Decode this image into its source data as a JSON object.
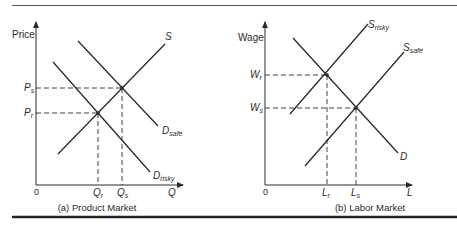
{
  "panels": [
    {
      "caption": "(a) Product Market",
      "y_axis_label": "Price",
      "x_axis_label": "Q",
      "origin": "0",
      "y_ticks": [
        {
          "base": "P",
          "sub": "s"
        },
        {
          "base": "P",
          "sub": "r"
        }
      ],
      "x_ticks": [
        {
          "base": "Q",
          "sub": "r"
        },
        {
          "base": "Q",
          "sub": "s"
        }
      ],
      "curves": [
        {
          "name": "S",
          "base": "S",
          "sub": ""
        },
        {
          "name": "D_safe",
          "base": "D",
          "sub": "safe"
        },
        {
          "name": "D_risky",
          "base": "D",
          "sub": "risky"
        }
      ]
    },
    {
      "caption": "(b) Labor Market",
      "y_axis_label": "Wage",
      "x_axis_label": "L",
      "origin": "0",
      "y_ticks": [
        {
          "base": "W",
          "sub": "r"
        },
        {
          "base": "W",
          "sub": "s"
        }
      ],
      "x_ticks": [
        {
          "base": "L",
          "sub": "r"
        },
        {
          "base": "L",
          "sub": "s"
        }
      ],
      "curves": [
        {
          "name": "S_risky",
          "base": "S",
          "sub": "risky"
        },
        {
          "name": "S_safe",
          "base": "S",
          "sub": "safe"
        },
        {
          "name": "D",
          "base": "D",
          "sub": ""
        }
      ]
    }
  ],
  "colors": {
    "ink": "#2a2a2a",
    "background": "#ffffff"
  }
}
